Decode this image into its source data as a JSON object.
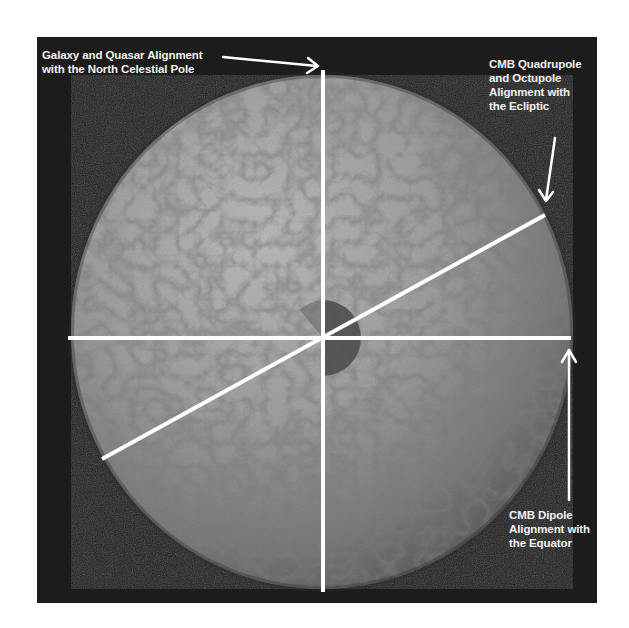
{
  "figure": {
    "background_color": "#1c1c1c",
    "sphere_color": "#9a9a9a",
    "line_color": "#ffffff",
    "labels": {
      "north_pole": "Galaxy and Quasar Alignment\nwith the North Celestial Pole",
      "ecliptic": "CMB Quadrupole\nand Octupole\nAlignment with\nthe Ecliptic",
      "equator": "CMB Dipole\nAlignment with\nthe Equator"
    },
    "axes": [
      {
        "name": "north-celestial-pole-axis",
        "orientation": "vertical"
      },
      {
        "name": "ecliptic-axis",
        "orientation": "diagonal"
      },
      {
        "name": "equator-axis",
        "orientation": "horizontal"
      }
    ]
  }
}
